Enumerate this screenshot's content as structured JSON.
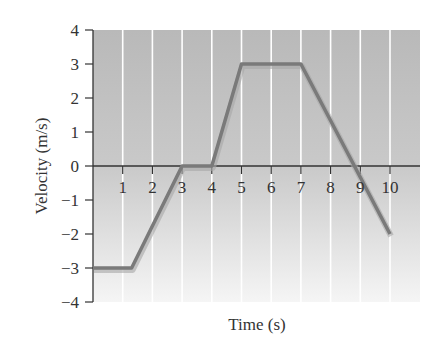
{
  "chart_data": {
    "type": "line",
    "title": "",
    "xlabel": "Time (s)",
    "ylabel": "Velocity (m/s)",
    "xlim": [
      0,
      11
    ],
    "ylim": [
      -4,
      4
    ],
    "x_ticks": [
      1,
      2,
      3,
      4,
      5,
      6,
      7,
      8,
      9,
      10
    ],
    "y_ticks": [
      4,
      3,
      2,
      1,
      0,
      -1,
      -2,
      -3,
      -4
    ],
    "grid": "vertical lines at each integer second",
    "legend": null,
    "series": [
      {
        "name": "velocity",
        "x": [
          0,
          1.3,
          3,
          4,
          5,
          7,
          8.8,
          10
        ],
        "y": [
          -3,
          -3,
          0,
          0,
          3,
          3,
          0,
          -2
        ]
      }
    ],
    "colors": {
      "line": "#7a7a7a",
      "plot_bg_top": "#b8b8b8",
      "plot_bg_bottom": "#f4f4f4",
      "grid": "#ffffff",
      "axis": "#333333"
    }
  }
}
